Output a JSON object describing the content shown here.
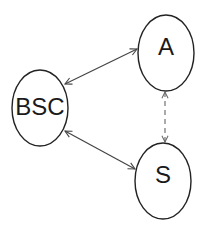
{
  "diagram": {
    "type": "state-graph",
    "colors": {
      "node_stroke": "#222222",
      "edge_solid": "#444444",
      "edge_dashed": "#666666",
      "background": "#ffffff"
    },
    "nodes": [
      {
        "id": "BSC",
        "label": "BSC",
        "shape": "ellipse",
        "cx": 40,
        "cy": 108,
        "rx": 28,
        "ry": 38
      },
      {
        "id": "A",
        "label": "A",
        "shape": "ellipse",
        "cx": 166,
        "cy": 53,
        "rx": 28,
        "ry": 38
      },
      {
        "id": "S",
        "label": "S",
        "shape": "ellipse",
        "cx": 163,
        "cy": 181,
        "rx": 28,
        "ry": 38
      }
    ],
    "edges": [
      {
        "from": "BSC",
        "to": "A",
        "style": "solid",
        "direction": "bidirectional"
      },
      {
        "from": "BSC",
        "to": "S",
        "style": "solid",
        "direction": "bidirectional"
      },
      {
        "from": "A",
        "to": "S",
        "style": "dashed",
        "direction": "bidirectional"
      }
    ]
  }
}
